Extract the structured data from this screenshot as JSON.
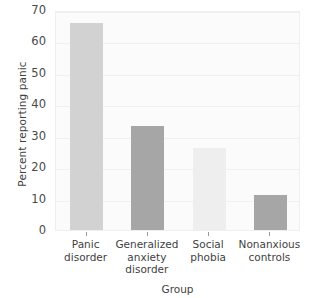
{
  "chart_data": {
    "type": "bar",
    "title": "",
    "xlabel": "Group",
    "ylabel": "Percent reporting panic",
    "categories": [
      "Panic disorder",
      "Generalized anxiety disorder",
      "Social phobia",
      "Nonanxious controls"
    ],
    "category_lines": [
      [
        "Panic",
        "disorder"
      ],
      [
        "Generalized",
        "anxiety",
        "disorder"
      ],
      [
        "Social",
        "phobia"
      ],
      [
        "Nonanxious",
        "controls"
      ]
    ],
    "values": [
      66,
      33,
      26,
      11
    ],
    "ylim": [
      0,
      70
    ],
    "yticks": [
      0,
      10,
      20,
      30,
      40,
      50,
      60,
      70
    ],
    "ytick_labels": [
      "0",
      "10",
      "20",
      "30",
      "40",
      "50",
      "60",
      "70"
    ],
    "grid": true,
    "legend": "none",
    "bar_colors": [
      "#d2d2d2",
      "#a6a6a6",
      "#eeeeee",
      "#a6a6a6"
    ],
    "plot_background": "#fbfbfb",
    "axis_color": "#9a9a9a",
    "text_color": "#3f3f3f"
  }
}
